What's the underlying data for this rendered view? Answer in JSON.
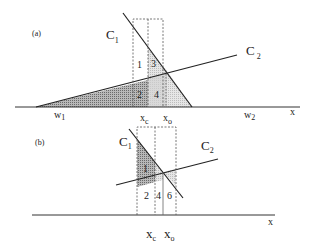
{
  "figure": {
    "panel_a": {
      "tag": "(a)",
      "curves": {
        "c1": {
          "base": "C",
          "sub": "1"
        },
        "c2": {
          "base": "C",
          "sub": "2"
        }
      },
      "axis_label": "x",
      "w1": {
        "base": "w",
        "sub": "1"
      },
      "w2": {
        "base": "w",
        "sub": "2"
      },
      "xc": {
        "base": "x",
        "sub": "c"
      },
      "xo": {
        "base": "x",
        "sub": "o"
      },
      "regions": [
        "1",
        "2",
        "3",
        "4"
      ]
    },
    "panel_b": {
      "tag": "(b)",
      "curves": {
        "c1": {
          "base": "C",
          "sub": "1"
        },
        "c2": {
          "base": "C",
          "sub": "2"
        }
      },
      "axis_label": "x",
      "xc": {
        "base": "x",
        "sub": "c"
      },
      "xo": {
        "base": "x",
        "sub": "o"
      },
      "regions": [
        "1",
        "2",
        "4",
        "6"
      ]
    },
    "colors": {
      "line": "#222222",
      "dark_fill": "#9a9a9a",
      "light_fill": "#d6d6d6",
      "dashed": "#555555"
    }
  }
}
